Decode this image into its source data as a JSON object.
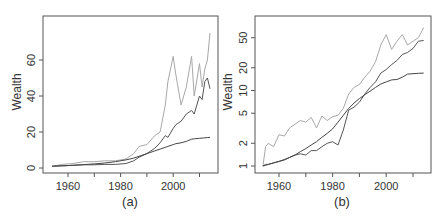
{
  "chart_data": [
    {
      "type": "line",
      "panel_label": "(a)",
      "title": "",
      "xlabel": "",
      "ylabel": "Wealth",
      "yscale": "linear",
      "xlim": [
        1951,
        2017
      ],
      "ylim": [
        -2,
        78
      ],
      "x_ticks": [
        1960,
        1970,
        1980,
        1990,
        2000,
        2010
      ],
      "x_tick_labels": [
        "1960",
        "",
        "1980",
        "",
        "2000",
        ""
      ],
      "y_ticks": [
        0,
        20,
        40,
        60
      ],
      "y_tick_labels": [
        "0",
        "20",
        "40",
        "60"
      ],
      "grid": false,
      "legend": null,
      "x": [
        1954,
        1958,
        1962,
        1966,
        1970,
        1974,
        1978,
        1982,
        1985,
        1987,
        1990,
        1993,
        1995,
        1997,
        1998,
        2000,
        2001,
        2003,
        2005,
        2007,
        2008,
        2010,
        2011,
        2012,
        2013,
        2014
      ],
      "series": [
        {
          "name": "light-grey-volatile",
          "color": "#a8a8a8",
          "values": [
            1,
            2,
            2.5,
            3.5,
            3.5,
            4,
            4,
            5,
            8,
            12,
            13,
            18,
            20,
            35,
            48,
            62,
            52,
            35,
            45,
            62,
            40,
            58,
            45,
            55,
            60,
            75
          ]
        },
        {
          "name": "dark-volatile",
          "color": "#555555",
          "values": [
            1,
            1.2,
            1.5,
            1.8,
            1.8,
            2,
            2,
            2.5,
            4,
            6,
            8,
            11,
            14,
            18,
            17,
            22,
            24,
            26,
            30,
            32,
            30,
            40,
            38,
            48,
            50,
            44
          ]
        },
        {
          "name": "dark-smooth",
          "color": "#444444",
          "values": [
            1,
            1.2,
            1.5,
            1.9,
            2.3,
            2.8,
            3.5,
            4.5,
            5.5,
            6.5,
            8,
            9.5,
            10.5,
            11.5,
            12,
            13,
            13.5,
            14,
            14.8,
            16,
            16.2,
            16.5,
            16.6,
            16.8,
            16.9,
            17
          ]
        }
      ]
    },
    {
      "type": "line",
      "panel_label": "(b)",
      "title": "",
      "xlabel": "",
      "ylabel": "Wealth",
      "yscale": "log",
      "xlim": [
        1951,
        2017
      ],
      "ylim": [
        0.9,
        80
      ],
      "x_ticks": [
        1960,
        1970,
        1980,
        1990,
        2000,
        2010
      ],
      "x_tick_labels": [
        "1960",
        "",
        "1980",
        "",
        "2000",
        ""
      ],
      "y_ticks": [
        1,
        2,
        5,
        10,
        20,
        50
      ],
      "y_tick_labels": [
        "1",
        "2",
        "5",
        "10",
        "20",
        "50"
      ],
      "grid": false,
      "legend": null,
      "x": [
        1954,
        1955,
        1956,
        1958,
        1960,
        1962,
        1964,
        1966,
        1968,
        1970,
        1972,
        1974,
        1976,
        1978,
        1980,
        1982,
        1984,
        1986,
        1988,
        1990,
        1992,
        1994,
        1996,
        1998,
        2000,
        2002,
        2004,
        2006,
        2008,
        2010,
        2012,
        2014
      ],
      "series": [
        {
          "name": "light-grey-volatile",
          "color": "#a8a8a8",
          "values": [
            1,
            1.8,
            2.0,
            1.8,
            2.6,
            2.5,
            3.2,
            3.6,
            4,
            3.8,
            4.4,
            3.2,
            4.6,
            4.0,
            4.5,
            4.7,
            5.8,
            9,
            11,
            12,
            15,
            18,
            24,
            40,
            55,
            35,
            45,
            55,
            40,
            45,
            50,
            68
          ]
        },
        {
          "name": "dark-volatile",
          "color": "#555555",
          "values": [
            1,
            1.05,
            1.05,
            1.1,
            1.15,
            1.2,
            1.3,
            1.4,
            1.45,
            1.4,
            1.6,
            1.6,
            1.8,
            2.0,
            2.1,
            1.9,
            3.0,
            5.5,
            6,
            7,
            9,
            11,
            13,
            17,
            19,
            22,
            25,
            30,
            32,
            36,
            45,
            46
          ]
        },
        {
          "name": "dark-smooth",
          "color": "#444444",
          "values": [
            1,
            1.02,
            1.05,
            1.1,
            1.15,
            1.22,
            1.3,
            1.4,
            1.55,
            1.7,
            1.9,
            2.1,
            2.4,
            2.7,
            3.1,
            3.8,
            4.7,
            5.8,
            6.8,
            7.8,
            8.8,
            9.8,
            11,
            12.2,
            13,
            13.8,
            14,
            15,
            16.5,
            16.7,
            16.9,
            17
          ]
        }
      ]
    }
  ]
}
